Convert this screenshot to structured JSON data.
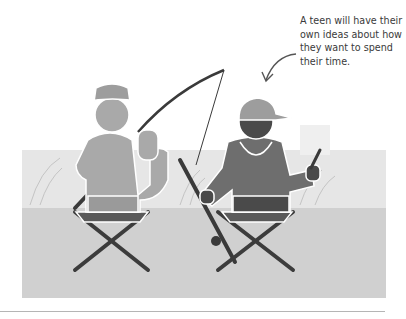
{
  "annotation": {
    "lines": [
      "A teen will have their",
      "own ideas about how",
      "they want to spend",
      "their time."
    ]
  },
  "illustration": {
    "subject": "adult and teen sitting on folding stools fishing, seen from behind",
    "colors": {
      "background_panel_top": "#e4e4e4",
      "background_panel_bottom": "#cfcfcf",
      "adult_figure": "#a9a9a9",
      "teen_figure": "#6e6e6e",
      "teen_dark": "#4a4a4a",
      "stool_legs": "#3c3c3c",
      "outline": "#ffffff"
    }
  }
}
